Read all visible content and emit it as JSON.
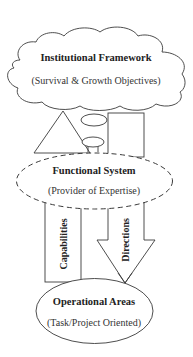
{
  "diagram": {
    "institutional": {
      "title": "Institutional Framework",
      "subtitle": "(Survival & Growth Objectives)"
    },
    "functional": {
      "title": "Functional System",
      "subtitle": "(Provider of Expertise)"
    },
    "operational": {
      "title": "Operational Areas",
      "subtitle": "(Task/Project Oriented)"
    },
    "flows": {
      "capabilities": "Capabilities",
      "directions": "Directions"
    },
    "colors": {
      "stroke": "#3a3a3a",
      "text": "#222222",
      "background": "#ffffff"
    }
  }
}
